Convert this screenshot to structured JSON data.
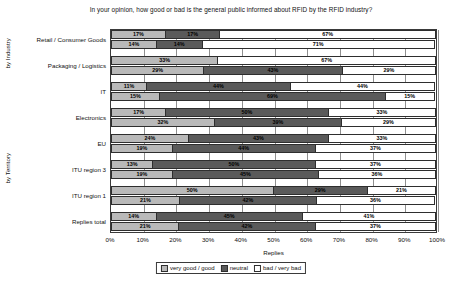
{
  "chart_data": {
    "type": "bar",
    "orientation": "horizontal",
    "stacked": true,
    "title": "In your opinion, how good or bad is the general public informed about RFID by the RFID industry?",
    "xlabel": "Replies",
    "ylabel": "",
    "xlim": [
      0,
      100
    ],
    "xunit": "%",
    "grid": true,
    "legend_position": "bottom",
    "xticks": [
      "0%",
      "10%",
      "20%",
      "30%",
      "40%",
      "50%",
      "60%",
      "70%",
      "80%",
      "90%",
      "100%"
    ],
    "series": [
      {
        "name": "very good / good",
        "color": "#b9b9b9"
      },
      {
        "name": "neutral",
        "color": "#5a5a5a"
      },
      {
        "name": "bad / very bad",
        "color": "#ffffff"
      }
    ],
    "axis_groups": [
      {
        "label": "by Industry"
      },
      {
        "label": "by Territory"
      }
    ],
    "categories": [
      "Retail / Consumer Goods",
      "Packaging / Logistics",
      "IT",
      "Electronics",
      "EU",
      "ITU region 3",
      "ITU region 1",
      "Replies total"
    ],
    "groups": [
      {
        "category": "Retail / Consumer Goods",
        "axis_group": "by Industry",
        "bars": [
          {
            "values": [
              17,
              17,
              67
            ],
            "labels": [
              "17%",
              "17%",
              "67%"
            ]
          },
          {
            "values": [
              14,
              14,
              71
            ],
            "labels": [
              "14%",
              "14%",
              "71%"
            ]
          }
        ]
      },
      {
        "category": "Packaging / Logistics",
        "axis_group": "by Industry",
        "bars": [
          {
            "values": [
              33,
              0,
              67
            ],
            "labels": [
              "33%",
              "",
              "67%"
            ]
          },
          {
            "values": [
              29,
              43,
              29
            ],
            "labels": [
              "29%",
              "43%",
              "29%"
            ]
          }
        ]
      },
      {
        "category": "IT",
        "axis_group": "by Industry",
        "bars": [
          {
            "values": [
              11,
              44,
              44
            ],
            "labels": [
              "11%",
              "44%",
              "44%"
            ]
          },
          {
            "values": [
              15,
              69,
              15
            ],
            "labels": [
              "15%",
              "69%",
              "15%"
            ]
          }
        ]
      },
      {
        "category": "Electronics",
        "axis_group": "by Industry",
        "bars": [
          {
            "values": [
              17,
              50,
              33
            ],
            "labels": [
              "17%",
              "50%",
              "33%"
            ]
          },
          {
            "values": [
              32,
              39,
              29
            ],
            "labels": [
              "32%",
              "39%",
              "29%"
            ]
          }
        ]
      },
      {
        "category": "EU",
        "axis_group": "by Territory",
        "bars": [
          {
            "values": [
              24,
              43,
              33
            ],
            "labels": [
              "24%",
              "43%",
              "33%"
            ]
          },
          {
            "values": [
              19,
              44,
              37
            ],
            "labels": [
              "19%",
              "44%",
              "37%"
            ]
          }
        ]
      },
      {
        "category": "ITU region 3",
        "axis_group": "by Territory",
        "bars": [
          {
            "values": [
              13,
              50,
              37
            ],
            "labels": [
              "13%",
              "50%",
              "37%"
            ]
          },
          {
            "values": [
              19,
              45,
              36
            ],
            "labels": [
              "19%",
              "45%",
              "36%"
            ]
          }
        ]
      },
      {
        "category": "ITU region 1",
        "axis_group": "by Territory",
        "bars": [
          {
            "values": [
              50,
              29,
              21
            ],
            "labels": [
              "50%",
              "29%",
              "21%"
            ]
          },
          {
            "values": [
              21,
              42,
              36
            ],
            "labels": [
              "21%",
              "42%",
              "36%"
            ]
          }
        ]
      },
      {
        "category": "Replies total",
        "axis_group": "by Territory",
        "bars": [
          {
            "values": [
              14,
              45,
              41
            ],
            "labels": [
              "14%",
              "45%",
              "41%"
            ]
          },
          {
            "values": [
              21,
              42,
              37
            ],
            "labels": [
              "21%",
              "42%",
              "37%"
            ]
          }
        ]
      }
    ]
  }
}
